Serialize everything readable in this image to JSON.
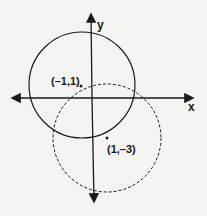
{
  "diagram": {
    "axes": {
      "x_label": "x",
      "y_label": "y"
    },
    "circles": [
      {
        "name": "solid-circle",
        "style": "solid",
        "center_label": "(-1,1)"
      },
      {
        "name": "dashed-circle",
        "style": "dashed",
        "center_label": "(1,-3)"
      }
    ],
    "colors": {
      "stroke": "#1a1a1a",
      "background": "#f4f4f2"
    }
  }
}
